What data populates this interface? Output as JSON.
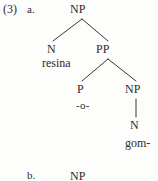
{
  "page": {
    "background_color": "#fdfdfc",
    "ink_color": "#2e2b29"
  },
  "example": {
    "number": "(3)",
    "items": [
      {
        "label": "a."
      },
      {
        "label": "b."
      }
    ]
  },
  "tree_a": {
    "root_label": "NP",
    "nodes": {
      "n1": "N",
      "pp": "PP",
      "p": "P",
      "np2": "NP",
      "n2": "N"
    },
    "terminals": {
      "n1_word": "resina",
      "p_word": "-o-",
      "n2_word": "gom-"
    }
  },
  "tree_b": {
    "root_label": "NP"
  }
}
